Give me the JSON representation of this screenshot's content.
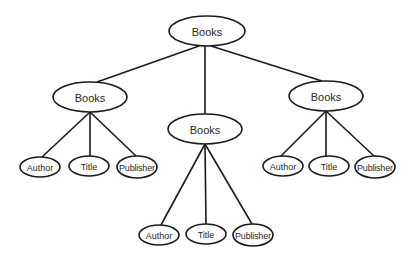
{
  "diagram": {
    "type": "tree",
    "title": "",
    "colors": {
      "stroke": "#1a1a1a",
      "fill": "#ffffff",
      "text": "#2a2a2a"
    },
    "nodes": [
      {
        "id": "root",
        "label": "Books",
        "cx": 207,
        "cy": 31,
        "rx": 38,
        "ry": 15,
        "size": "big"
      },
      {
        "id": "books_l",
        "label": "Books",
        "cx": 90,
        "cy": 97,
        "rx": 37,
        "ry": 15,
        "size": "big"
      },
      {
        "id": "books_m",
        "label": "Books",
        "cx": 205,
        "cy": 129,
        "rx": 37,
        "ry": 15,
        "size": "big"
      },
      {
        "id": "books_r",
        "label": "Books",
        "cx": 326,
        "cy": 96,
        "rx": 37,
        "ry": 15,
        "size": "big"
      },
      {
        "id": "author_l",
        "label": "Author",
        "cx": 40,
        "cy": 167,
        "rx": 20,
        "ry": 10,
        "size": "small"
      },
      {
        "id": "title_l",
        "label": "Title",
        "cx": 89,
        "cy": 166,
        "rx": 20,
        "ry": 10,
        "size": "small"
      },
      {
        "id": "pub_l",
        "label": "Publisher",
        "cx": 137,
        "cy": 167,
        "rx": 20,
        "ry": 11,
        "size": "small"
      },
      {
        "id": "author_m",
        "label": "Author",
        "cx": 159,
        "cy": 235,
        "rx": 20,
        "ry": 10,
        "size": "small"
      },
      {
        "id": "title_m",
        "label": "Title",
        "cx": 206,
        "cy": 234,
        "rx": 20,
        "ry": 10,
        "size": "small"
      },
      {
        "id": "pub_m",
        "label": "Publisher",
        "cx": 253,
        "cy": 235,
        "rx": 20,
        "ry": 11,
        "size": "small"
      },
      {
        "id": "author_r",
        "label": "Author",
        "cx": 283,
        "cy": 166,
        "rx": 20,
        "ry": 10,
        "size": "small"
      },
      {
        "id": "title_r",
        "label": "Title",
        "cx": 329,
        "cy": 166,
        "rx": 20,
        "ry": 10,
        "size": "small"
      },
      {
        "id": "pub_r",
        "label": "Publisher",
        "cx": 375,
        "cy": 167,
        "rx": 20,
        "ry": 11,
        "size": "small"
      }
    ],
    "edges": [
      {
        "from": "root",
        "to": "books_l",
        "x1": 199,
        "y1": 46,
        "x2": 97,
        "y2": 82
      },
      {
        "from": "root",
        "to": "books_m",
        "x1": 205,
        "y1": 46,
        "x2": 205,
        "y2": 114
      },
      {
        "from": "root",
        "to": "books_r",
        "x1": 211,
        "y1": 46,
        "x2": 322,
        "y2": 81
      },
      {
        "from": "books_l",
        "to": "author_l",
        "x1": 90,
        "y1": 112,
        "x2": 42,
        "y2": 157
      },
      {
        "from": "books_l",
        "to": "title_l",
        "x1": 90,
        "y1": 112,
        "x2": 90,
        "y2": 156
      },
      {
        "from": "books_l",
        "to": "pub_l",
        "x1": 90,
        "y1": 112,
        "x2": 136,
        "y2": 156
      },
      {
        "from": "books_m",
        "to": "author_m",
        "x1": 205,
        "y1": 144,
        "x2": 161,
        "y2": 225
      },
      {
        "from": "books_m",
        "to": "title_m",
        "x1": 205,
        "y1": 144,
        "x2": 206,
        "y2": 224
      },
      {
        "from": "books_m",
        "to": "pub_m",
        "x1": 205,
        "y1": 144,
        "x2": 252,
        "y2": 224
      },
      {
        "from": "books_r",
        "to": "author_r",
        "x1": 326,
        "y1": 111,
        "x2": 281,
        "y2": 156
      },
      {
        "from": "books_r",
        "to": "title_r",
        "x1": 326,
        "y1": 111,
        "x2": 326,
        "y2": 156
      },
      {
        "from": "books_r",
        "to": "pub_r",
        "x1": 326,
        "y1": 111,
        "x2": 374,
        "y2": 156
      }
    ]
  }
}
